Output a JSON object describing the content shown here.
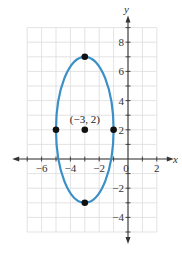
{
  "chart_data": {
    "type": "scatter",
    "title": "",
    "xlabel": "x",
    "ylabel": "y",
    "xlim": [
      -7,
      2
    ],
    "ylim": [
      -5,
      9
    ],
    "grid": true,
    "x_ticks": [
      -6,
      -4,
      -2,
      0,
      2
    ],
    "y_ticks": [
      -4,
      -2,
      2,
      4,
      6,
      8
    ],
    "x_tick_labels": [
      "−6",
      "−4",
      "−2",
      "0",
      "2"
    ],
    "y_tick_labels": [
      "−4",
      "−2",
      "2",
      "4",
      "6",
      "8"
    ],
    "curve": {
      "shape": "ellipse",
      "center": [
        -3,
        2
      ],
      "semi_axis_x": 2,
      "semi_axis_y": 5,
      "color": "#3a8fc7"
    },
    "points": [
      {
        "x": -3,
        "y": 7
      },
      {
        "x": -5,
        "y": 2
      },
      {
        "x": -3,
        "y": 2
      },
      {
        "x": -1,
        "y": 2
      },
      {
        "x": -3,
        "y": -3
      }
    ],
    "annotations": [
      {
        "text": "(−3, 2)",
        "x": -3,
        "y": 2
      }
    ]
  }
}
